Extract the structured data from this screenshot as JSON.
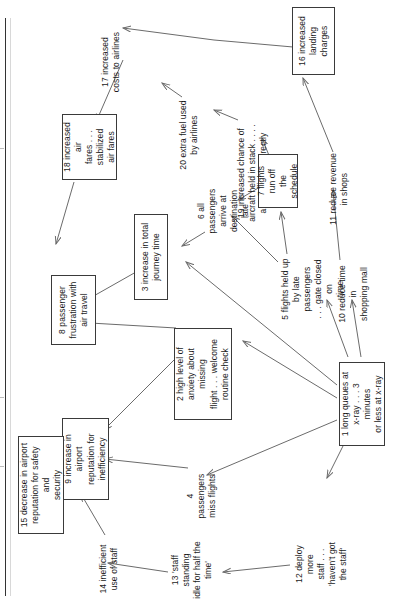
{
  "diagram": {
    "type": "causal-map",
    "orientation": "text rotated 90 degrees counter-clockwise",
    "nodes": [
      {
        "id": "1",
        "number": "1",
        "label": "1 long queues at\nx-ray . . . 3 minutes\nor less at x-ray",
        "boxed": true
      },
      {
        "id": "2",
        "number": "2",
        "label": "2 high level of\nanxiety about missing\nflight . . . welcome\nroutine check",
        "boxed": true
      },
      {
        "id": "3",
        "number": "3",
        "label": "3 increase in total\njourney time",
        "boxed": true
      },
      {
        "id": "4",
        "number": "4",
        "label": "4 passengers\nmiss flights",
        "boxed": false
      },
      {
        "id": "5",
        "number": "5",
        "label": "5 flights held up\nby late passengers\n. . . gate closed on\ntime",
        "boxed": false
      },
      {
        "id": "6",
        "number": "6",
        "label": "6 all passengers\narrive at\ndestination late",
        "boxed": false
      },
      {
        "id": "7",
        "number": "7",
        "label": "7 flights run off\nthe schedule",
        "boxed": true
      },
      {
        "id": "8",
        "number": "8",
        "label": "8 passenger\nfrustration with\nair travel",
        "boxed": true
      },
      {
        "id": "9",
        "number": "9",
        "label": "9 increase in airport\nreputation for\ninefficiency",
        "boxed": true
      },
      {
        "id": "10",
        "number": "10",
        "label": "10 reduce time in\nshopping mall",
        "boxed": false
      },
      {
        "id": "11",
        "number": "11",
        "label": "11 reduce revenue\nin shops",
        "boxed": false
      },
      {
        "id": "12",
        "number": "12",
        "label": "12 deploy more\nstaff . . . 'haven't got\nthe staff'",
        "boxed": false
      },
      {
        "id": "13",
        "number": "13",
        "label": "13 'staff standing\nidle for half the\ntime'",
        "boxed": false
      },
      {
        "id": "14",
        "number": "14",
        "label": "14 inefficient\nuse of staff",
        "boxed": false
      },
      {
        "id": "15",
        "number": "15",
        "label": "15 decrease in airport\nreputation for safety and\nsecurity",
        "boxed": true
      },
      {
        "id": "16",
        "number": "16",
        "label": "16 increased\nlanding charges",
        "boxed": true
      },
      {
        "id": "17",
        "number": "17",
        "label": "17 increased\ncosts to airlines",
        "boxed": false
      },
      {
        "id": "18",
        "number": "18",
        "label": "18 increased air\nfares . . . stabilized\nair fares",
        "boxed": true
      },
      {
        "id": "19",
        "number": "19",
        "label": "19 increased chance of\naircraft held in stack . . . .\narrive to land directly",
        "boxed": false
      },
      {
        "id": "20",
        "number": "20",
        "label": "20 extra fuel used\nby airlines",
        "boxed": false
      }
    ],
    "edges": [
      {
        "from": "1",
        "to": "2"
      },
      {
        "from": "1",
        "to": "4"
      },
      {
        "from": "1",
        "to": "3"
      },
      {
        "from": "1",
        "to": "5"
      },
      {
        "from": "1",
        "to": "10"
      },
      {
        "from": "1",
        "to": "12"
      },
      {
        "from": "2",
        "to": "8"
      },
      {
        "from": "2",
        "to": "9"
      },
      {
        "from": "3",
        "to": "8"
      },
      {
        "from": "4",
        "to": "9"
      },
      {
        "from": "5",
        "to": "7"
      },
      {
        "from": "5",
        "to": "6"
      },
      {
        "from": "6",
        "to": "3"
      },
      {
        "from": "7",
        "to": "6"
      },
      {
        "from": "7",
        "to": "19"
      },
      {
        "from": "10",
        "to": "11"
      },
      {
        "from": "11",
        "to": "16"
      },
      {
        "from": "12",
        "to": "13"
      },
      {
        "from": "13",
        "to": "14"
      },
      {
        "from": "14",
        "to": "9"
      },
      {
        "from": "9",
        "to": "15"
      },
      {
        "from": "16",
        "to": "17"
      },
      {
        "from": "17",
        "to": "18"
      },
      {
        "from": "18",
        "to": "8"
      },
      {
        "from": "19",
        "to": "20"
      },
      {
        "from": "20",
        "to": "17"
      }
    ]
  },
  "colors": {
    "node_border": "#3a3a3a",
    "arrow": "#6b6b6b",
    "text": "#1b1b1b",
    "background": "#ffffff"
  }
}
